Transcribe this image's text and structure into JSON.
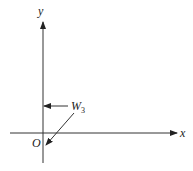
{
  "diagram": {
    "type": "coordinate-axes-vector",
    "axes": {
      "x_label": "x",
      "y_label": "y",
      "origin_label": "O"
    },
    "vector": {
      "label": "W",
      "subscript": "3",
      "description": "horizontal arrow pointing left toward y-axis, with diagonal leader line toward origin"
    },
    "colors": {
      "stroke": "#333333",
      "background": "#ffffff"
    }
  }
}
